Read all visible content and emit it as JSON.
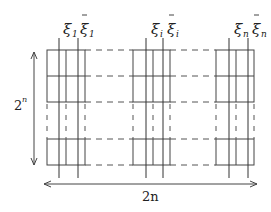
{
  "diagram": {
    "title": "",
    "vertical_dimension": {
      "base": "2",
      "exponent": "n"
    },
    "horizontal_dimension": {
      "label": "2n"
    },
    "blocks": [
      {
        "id": "block-1",
        "left_label": {
          "symbol": "ξ",
          "subscript": "1",
          "bar": false
        },
        "right_label": {
          "symbol": "ξ",
          "subscript": "1",
          "bar": true
        }
      },
      {
        "id": "block-i",
        "left_label": {
          "symbol": "ξ",
          "subscript": "i",
          "bar": false
        },
        "right_label": {
          "symbol": "ξ",
          "subscript": "i",
          "bar": true
        }
      },
      {
        "id": "block-n",
        "left_label": {
          "symbol": "ξ",
          "subscript": "n",
          "bar": false
        },
        "right_label": {
          "symbol": "ξ",
          "subscript": "n",
          "bar": true
        }
      }
    ],
    "rows_visible": 3,
    "colors": {
      "line": "#444444",
      "background": "#ffffff"
    }
  }
}
